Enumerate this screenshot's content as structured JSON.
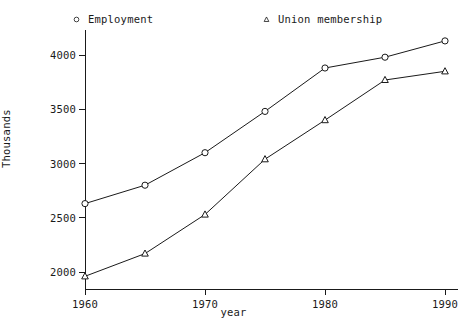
{
  "chart_data": {
    "type": "line",
    "title": "",
    "xlabel": "year",
    "ylabel": "Thousands",
    "x": [
      1960,
      1965,
      1970,
      1975,
      1980,
      1985,
      1990
    ],
    "xlim": [
      1958,
      1992
    ],
    "ylim": [
      1850,
      4250
    ],
    "xticks": [
      1960,
      1970,
      1980,
      1990
    ],
    "xtick_labels": [
      "1960",
      "1970",
      "1980",
      "1990"
    ],
    "yticks": [
      2000,
      2500,
      3000,
      3500,
      4000
    ],
    "ytick_labels": [
      "2000",
      "2500",
      "3000",
      "3500",
      "4000"
    ],
    "grid": false,
    "legend_position": "top",
    "series": [
      {
        "name": "Employment",
        "marker": "circle",
        "color": "#1a1a1a",
        "values": [
          2630,
          2800,
          3100,
          3480,
          3880,
          3980,
          4130
        ]
      },
      {
        "name": "Union membership",
        "marker": "triangle",
        "color": "#1a1a1a",
        "values": [
          1960,
          2170,
          2530,
          3040,
          3400,
          3770,
          3850
        ]
      }
    ]
  },
  "legend": {
    "entries": [
      {
        "label": "Employment",
        "marker": "circle"
      },
      {
        "label": "Union membership",
        "marker": "triangle"
      }
    ]
  },
  "axes": {
    "x_title": "year",
    "y_title": "Thousands"
  }
}
